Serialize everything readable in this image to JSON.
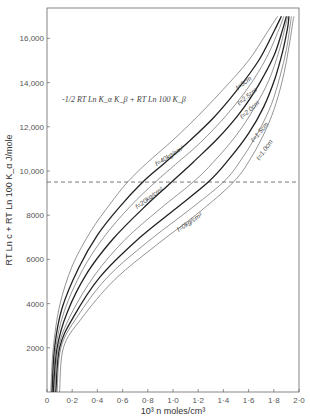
{
  "chart_data": {
    "type": "line",
    "title": "",
    "annotation": "-1/2 RT Ln K_α K_β + RT Ln 100 K_β",
    "xlabel": "10³ n moles/cm³",
    "ylabel": "RT Ln c + RT Ln 100 K_α J/mole",
    "xlim": [
      0,
      2.0
    ],
    "ylim": [
      0,
      17200
    ],
    "x_ticks": [
      0,
      0.2,
      0.4,
      0.6,
      0.8,
      1.0,
      1.2,
      1.4,
      1.6,
      1.8,
      2.0
    ],
    "x_tick_labels": [
      "0",
      "0·2",
      "0·4",
      "0·6",
      "0·8",
      "1·0",
      "1·2",
      "1·4",
      "1·6",
      "1·8",
      "2·0"
    ],
    "y_ticks": [
      2000,
      4000,
      6000,
      8000,
      10000,
      12000,
      14000,
      16000
    ],
    "y_tick_labels": [
      "2000",
      "4000",
      "6000",
      "8000",
      "10,000",
      "12,000",
      "14,000",
      "16,000"
    ],
    "grid": false,
    "legend": "inline curve labels",
    "reference_line": {
      "y": 9500,
      "style": "dashed",
      "label": "-1/2 RT Ln K_α K_β + RT Ln 100 K_β"
    },
    "series": [
      {
        "name": "ℓ = 3 cm",
        "label": "ℓ=3cm",
        "weight": "thin",
        "x": [
          0.03,
          0.05,
          0.1,
          0.2,
          0.35,
          0.5,
          0.64,
          0.8,
          1.0,
          1.2,
          1.4,
          1.6,
          1.75,
          1.83
        ],
        "y": [
          0,
          2000,
          3900,
          5700,
          7300,
          8500,
          9500,
          10400,
          11400,
          12500,
          13700,
          15000,
          16300,
          17000
        ]
      },
      {
        "name": "f = 40 kg/cm²",
        "label": "f=40kg/cm²",
        "weight": "heavy",
        "x": [
          0.04,
          0.06,
          0.12,
          0.25,
          0.4,
          0.58,
          0.76,
          0.92,
          1.12,
          1.32,
          1.5,
          1.68,
          1.8,
          1.86
        ],
        "y": [
          0,
          2000,
          3800,
          5600,
          7100,
          8400,
          9500,
          10300,
          11300,
          12400,
          13600,
          15000,
          16300,
          17000
        ]
      },
      {
        "name": "ℓ = 2.5 cm",
        "label": "ℓ=2.5cm",
        "weight": "thin",
        "x": [
          0.05,
          0.07,
          0.14,
          0.28,
          0.45,
          0.66,
          0.86,
          1.02,
          1.22,
          1.42,
          1.6,
          1.74,
          1.84,
          1.88
        ],
        "y": [
          0,
          2000,
          3700,
          5500,
          7000,
          8400,
          9500,
          10300,
          11300,
          12500,
          13800,
          15100,
          16400,
          17000
        ]
      },
      {
        "name": "f = 20 kg/cm²",
        "label": "f=20kg/cm²",
        "weight": "heavy",
        "x": [
          0.05,
          0.08,
          0.16,
          0.32,
          0.52,
          0.76,
          0.99,
          1.16,
          1.36,
          1.54,
          1.68,
          1.8,
          1.87,
          1.9
        ],
        "y": [
          0,
          2000,
          3600,
          5400,
          6900,
          8300,
          9500,
          10400,
          11500,
          12700,
          13900,
          15200,
          16400,
          17000
        ]
      },
      {
        "name": "ℓ = 2.0 cm",
        "label": "ℓ=2.0cm",
        "weight": "thin",
        "x": [
          0.06,
          0.09,
          0.19,
          0.38,
          0.62,
          0.9,
          1.16,
          1.32,
          1.5,
          1.64,
          1.76,
          1.84,
          1.89,
          1.91
        ],
        "y": [
          0,
          2000,
          3500,
          5300,
          6900,
          8300,
          9500,
          10400,
          11600,
          12800,
          14100,
          15400,
          16500,
          17000
        ]
      },
      {
        "name": "f = 0 kg/cm²",
        "label": "f=0kg/cm²",
        "weight": "heavy",
        "x": [
          0.07,
          0.1,
          0.21,
          0.42,
          0.7,
          1.0,
          1.28,
          1.44,
          1.6,
          1.72,
          1.81,
          1.87,
          1.91,
          1.92
        ],
        "y": [
          0,
          2000,
          3400,
          5200,
          6800,
          8200,
          9500,
          10500,
          11700,
          12900,
          14200,
          15400,
          16500,
          17000
        ]
      },
      {
        "name": "ℓ = 1.5 cm",
        "label": "ℓ=1.5cm",
        "weight": "thin",
        "x": [
          0.08,
          0.11,
          0.24,
          0.48,
          0.8,
          1.12,
          1.4,
          1.54,
          1.68,
          1.78,
          1.85,
          1.9,
          1.93,
          1.94
        ],
        "y": [
          0,
          2000,
          3400,
          5200,
          6800,
          8200,
          9500,
          10500,
          11800,
          13000,
          14300,
          15500,
          16600,
          17000
        ]
      },
      {
        "name": "ℓ = 1.0 cm",
        "label": "ℓ=1.0cm",
        "weight": "thin",
        "x": [
          0.1,
          0.13,
          0.27,
          0.54,
          0.88,
          1.2,
          1.48,
          1.62,
          1.74,
          1.82,
          1.88,
          1.92,
          1.95,
          1.96
        ],
        "y": [
          0,
          2000,
          3300,
          5100,
          6700,
          8100,
          9500,
          10600,
          11900,
          13100,
          14400,
          15600,
          16700,
          17000
        ]
      }
    ],
    "curve_labels": [
      {
        "text": "ℓ=3cm",
        "x": 1.57,
        "y": 13900,
        "angle": -38
      },
      {
        "text": "ℓ=2.5cm",
        "x": 1.6,
        "y": 13300,
        "angle": -40
      },
      {
        "text": "ℓ=2.0cm",
        "x": 1.62,
        "y": 12700,
        "angle": -42
      },
      {
        "text": "ℓ=1.5cm",
        "x": 1.7,
        "y": 11700,
        "angle": -50
      },
      {
        "text": "ℓ=1.0cm",
        "x": 1.74,
        "y": 10900,
        "angle": -55
      },
      {
        "text": "f=40kg/cm²",
        "x": 0.98,
        "y": 10600,
        "angle": -32
      },
      {
        "text": "f=20kg/cm²",
        "x": 0.82,
        "y": 8700,
        "angle": -36
      },
      {
        "text": "f=0kg/cm²",
        "x": 1.14,
        "y": 7600,
        "angle": -34
      }
    ]
  },
  "geometry": {
    "plot_left": 47,
    "plot_right": 299,
    "plot_top": 8,
    "plot_bottom": 392,
    "x_scale_px_per_unit": 126,
    "y_scale_px_per_unit": 0.0221
  }
}
